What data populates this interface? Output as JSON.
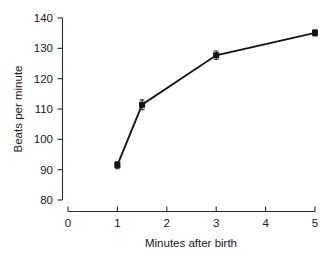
{
  "chart_data": {
    "type": "line",
    "title": "",
    "xlabel": "Minutes after birth",
    "ylabel": "Beats per minute",
    "xlim": [
      0,
      5
    ],
    "ylim": [
      80,
      140
    ],
    "grid": false,
    "legend": null,
    "x_ticks": [
      "0",
      "1",
      "2",
      "3",
      "4",
      "5"
    ],
    "x_tick_values": [
      0,
      1,
      2,
      3,
      4,
      5
    ],
    "y_ticks": [
      "80",
      "90",
      "100",
      "110",
      "120",
      "130",
      "140"
    ],
    "y_tick_values": [
      80,
      90,
      100,
      110,
      120,
      130,
      140
    ],
    "series": [
      {
        "name": "Heart rate",
        "marker": "square",
        "color": "#111111",
        "x": [
          1,
          1.5,
          3,
          5
        ],
        "values": [
          91.5,
          111.4,
          127.7,
          135.1
        ],
        "error": [
          1.2,
          1.6,
          1.4,
          1.0
        ]
      }
    ]
  },
  "axes": {
    "y_axis_name": "y-axis",
    "x_axis_name": "x-axis"
  }
}
